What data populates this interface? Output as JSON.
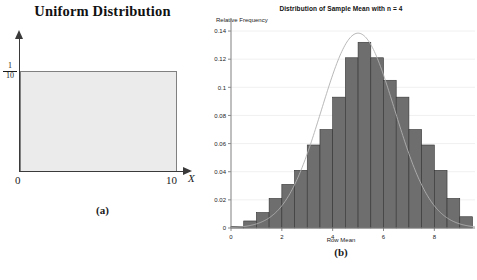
{
  "panel_a": {
    "title": "Uniform Distribution",
    "caption": "(a)",
    "y_label_numerator": "1",
    "y_label_denominator": "10",
    "x_tick_min": "0",
    "x_tick_max": "10",
    "x_variable": "X",
    "fill_color": "#ebebeb",
    "stroke_color": "#808080"
  },
  "panel_b": {
    "title": "Distribution of Sample Mean with n = 4",
    "caption": "(b)",
    "y_axis_title": "Relative Frequency",
    "x_axis_title": "Row Mean",
    "bar_color": "#6e6e6e",
    "bar_edge_color": "#333333",
    "curve_color": "#b0b0b0",
    "axis_color": "#8a8a8a",
    "grid_color": "#eaeaea"
  },
  "bottom_caption": "",
  "chart_data": {
    "type": "bar",
    "title": "Distribution of Sample Mean with n = 4",
    "xlabel": "Row Mean",
    "ylabel": "Relative Frequency",
    "xlim": [
      0,
      9.6
    ],
    "ylim": [
      0,
      0.145
    ],
    "xticks": [
      0,
      2,
      4,
      6,
      8
    ],
    "xticklabels": [
      "0",
      "2",
      "4",
      "6",
      "8"
    ],
    "yticks": [
      0,
      0.02,
      0.04,
      0.06,
      0.08,
      0.1,
      0.12,
      0.14
    ],
    "yticklabels": [
      "0",
      "0.02",
      "0.04",
      "0.06",
      "0.08",
      "0.1",
      "0.12",
      "0.14"
    ],
    "grid": true,
    "legend": "none",
    "bin_width": 0.5,
    "bin_starts": [
      0.0,
      0.5,
      1.0,
      1.5,
      2.0,
      2.5,
      3.0,
      3.5,
      4.0,
      4.5,
      5.0,
      5.5,
      6.0,
      6.5,
      7.0,
      7.5,
      8.0,
      8.5,
      9.0
    ],
    "categories": [
      "0.25",
      "0.75",
      "1.25",
      "1.75",
      "2.25",
      "2.75",
      "3.25",
      "3.75",
      "4.25",
      "4.75",
      "5.25",
      "5.75",
      "6.25",
      "6.75",
      "7.25",
      "7.75",
      "8.25",
      "8.75",
      "9.25"
    ],
    "values": [
      0.001,
      0.005,
      0.011,
      0.021,
      0.031,
      0.041,
      0.059,
      0.07,
      0.093,
      0.121,
      0.132,
      0.121,
      0.105,
      0.093,
      0.07,
      0.059,
      0.041,
      0.021,
      0.008
    ],
    "overlay_curve": {
      "type": "normal",
      "mean": 5.0,
      "sd": 1.44,
      "peak_value": 0.1385,
      "color": "#b0b0b0"
    }
  }
}
